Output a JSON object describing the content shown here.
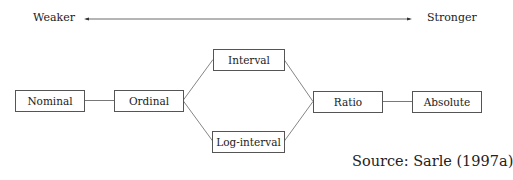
{
  "scale": {
    "weaker": "Weaker",
    "stronger": "Stronger"
  },
  "nodes": [
    {
      "id": "nominal",
      "label": "Nominal"
    },
    {
      "id": "ordinal",
      "label": "Ordinal"
    },
    {
      "id": "interval",
      "label": "Interval"
    },
    {
      "id": "log_interval",
      "label": "Log-interval"
    },
    {
      "id": "ratio",
      "label": "Ratio"
    },
    {
      "id": "absolute",
      "label": "Absolute"
    }
  ],
  "edges": [
    [
      "nominal",
      "ordinal"
    ],
    [
      "ordinal",
      "interval"
    ],
    [
      "ordinal",
      "log_interval"
    ],
    [
      "interval",
      "ratio"
    ],
    [
      "log_interval",
      "ratio"
    ],
    [
      "ratio",
      "absolute"
    ]
  ],
  "source": "Source: Sarle (1997a)"
}
